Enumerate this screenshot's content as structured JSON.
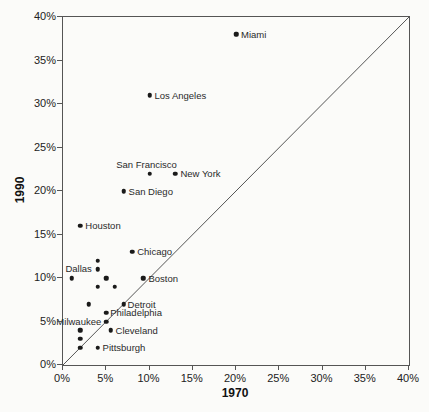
{
  "chart_data": {
    "type": "scatter",
    "title": "",
    "xlabel": "1970",
    "ylabel": "1990",
    "xlim": [
      0,
      40
    ],
    "ylim": [
      0,
      40
    ],
    "grid": false,
    "legend": false,
    "tick_values": [
      0,
      5,
      10,
      15,
      20,
      25,
      30,
      35,
      40
    ],
    "x_ticks": [
      "0%",
      "5%",
      "10%",
      "15%",
      "20%",
      "25%",
      "30%",
      "35%",
      "40%"
    ],
    "y_ticks": [
      "0%",
      "5%",
      "10%",
      "15%",
      "20%",
      "25%",
      "30%",
      "35%",
      "40%"
    ],
    "reference_line": {
      "type": "diagonal",
      "from": [
        0,
        0
      ],
      "to": [
        40,
        40
      ]
    },
    "points": [
      {
        "label": "Miami",
        "x": 20,
        "y": 38,
        "label_pos": "right"
      },
      {
        "label": "Los Angeles",
        "x": 10,
        "y": 31,
        "label_pos": "right"
      },
      {
        "label": "San Francisco",
        "x": 10,
        "y": 22,
        "label_pos": "above",
        "label_dx": -3
      },
      {
        "label": "New York",
        "x": 13,
        "y": 22,
        "label_pos": "right"
      },
      {
        "label": "San Diego",
        "x": 7,
        "y": 20,
        "label_pos": "right"
      },
      {
        "label": "Houston",
        "x": 2,
        "y": 16,
        "label_pos": "right"
      },
      {
        "label": "Chicago",
        "x": 8,
        "y": 13,
        "label_pos": "right"
      },
      {
        "label": "Dallas",
        "x": 1,
        "y": 10,
        "label_pos": "above",
        "label_dx": 7
      },
      {
        "label": "Boston",
        "x": 9.3,
        "y": 10,
        "label_pos": "right"
      },
      {
        "label": "Detroit",
        "x": 7,
        "y": 7,
        "label_pos": "right",
        "label_dx": -1
      },
      {
        "label": "Philadelphia",
        "x": 5,
        "y": 6,
        "label_pos": "right",
        "label_dx": -1
      },
      {
        "label": "Milwaukee",
        "x": 5,
        "y": 5,
        "label_pos": "left"
      },
      {
        "label": "Cleveland",
        "x": 5.5,
        "y": 4,
        "label_pos": "right"
      },
      {
        "label": "Pittsburgh",
        "x": 4,
        "y": 2,
        "label_pos": "right"
      },
      {
        "label": "",
        "x": 4,
        "y": 12
      },
      {
        "label": "",
        "x": 4,
        "y": 11
      },
      {
        "label": "",
        "x": 5,
        "y": 10
      },
      {
        "label": "",
        "x": 4,
        "y": 9
      },
      {
        "label": "",
        "x": 6,
        "y": 9
      },
      {
        "label": "",
        "x": 3,
        "y": 7
      },
      {
        "label": "",
        "x": 2,
        "y": 4
      },
      {
        "label": "",
        "x": 2,
        "y": 3
      },
      {
        "label": "",
        "x": 2,
        "y": 2
      }
    ],
    "colors": {
      "background": "#fbfbf9",
      "axis": "#555555",
      "point": "#1a1a1a",
      "text": "#222222"
    }
  }
}
